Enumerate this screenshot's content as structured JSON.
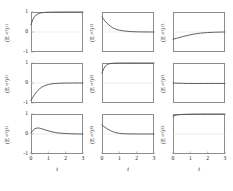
{
  "figure": {
    "rows": 3,
    "cols": 3,
    "xlabel": "t",
    "axis_color": "#8c8c8c",
    "curve_color": "#4d4d4d",
    "zero_gridline_color": "#d8d8d8",
    "xticks": [
      "0",
      "1",
      "2",
      "3"
    ],
    "xlim": [
      0,
      3
    ],
    "yticks": [
      "1",
      "0",
      "-1"
    ],
    "ylim": [
      -1,
      1
    ]
  },
  "chart_data": [
    {
      "type": "line",
      "title": "",
      "panel": "1,1",
      "ylabel_prefix": "(E",
      "ylabel_sub_eff": "eff",
      "ylabel_close": ")",
      "ylabel_index": "11",
      "xlabel": "t",
      "ylabel": "(E_eff)_11",
      "xlim": [
        0,
        3
      ],
      "ylim": [
        -1,
        1
      ],
      "grid": false,
      "x": [
        0,
        0.1,
        0.2,
        0.3,
        0.4,
        0.5,
        0.6,
        0.7,
        0.8,
        0.9,
        1.0,
        1.2,
        1.4,
        1.6,
        1.8,
        2.0,
        2.2,
        2.4,
        2.6,
        2.8,
        3.0
      ],
      "values": [
        0.36,
        0.61,
        0.76,
        0.85,
        0.9,
        0.94,
        0.96,
        0.97,
        0.98,
        0.985,
        0.99,
        0.995,
        0.997,
        0.998,
        0.999,
        1.0,
        1.0,
        1.0,
        1.0,
        1.0,
        1.0
      ]
    },
    {
      "type": "line",
      "title": "",
      "panel": "1,2",
      "ylabel_prefix": "(E",
      "ylabel_sub_eff": "eff",
      "ylabel_close": ")",
      "ylabel_index": "12",
      "xlabel": "t",
      "ylabel": "(E_eff)_12",
      "xlim": [
        0,
        3
      ],
      "ylim": [
        -1,
        1
      ],
      "grid": false,
      "x": [
        0,
        0.1,
        0.2,
        0.3,
        0.4,
        0.5,
        0.6,
        0.7,
        0.8,
        0.9,
        1.0,
        1.2,
        1.4,
        1.6,
        1.8,
        2.0,
        2.2,
        2.4,
        2.6,
        2.8,
        3.0
      ],
      "values": [
        0.75,
        0.63,
        0.52,
        0.43,
        0.35,
        0.28,
        0.22,
        0.18,
        0.14,
        0.11,
        0.09,
        0.06,
        0.04,
        0.025,
        0.015,
        0.01,
        0.006,
        0.004,
        0.002,
        0.001,
        0.0
      ]
    },
    {
      "type": "line",
      "title": "",
      "panel": "1,3",
      "ylabel_prefix": "(E",
      "ylabel_sub_eff": "eff",
      "ylabel_close": ")",
      "ylabel_index": "13",
      "xlabel": "t",
      "ylabel": "(E_eff)_13",
      "xlim": [
        0,
        3
      ],
      "ylim": [
        -1,
        1
      ],
      "grid": false,
      "x": [
        0,
        0.2,
        0.4,
        0.6,
        0.8,
        1.0,
        1.2,
        1.4,
        1.6,
        1.8,
        2.0,
        2.2,
        2.4,
        2.6,
        2.8,
        3.0
      ],
      "values": [
        -0.36,
        -0.32,
        -0.27,
        -0.22,
        -0.18,
        -0.14,
        -0.105,
        -0.08,
        -0.055,
        -0.04,
        -0.028,
        -0.018,
        -0.012,
        -0.007,
        -0.003,
        0.0
      ]
    },
    {
      "type": "line",
      "title": "",
      "panel": "2,1",
      "ylabel_prefix": "(E",
      "ylabel_sub_eff": "eff",
      "ylabel_close": ")",
      "ylabel_index": "21",
      "xlabel": "t",
      "ylabel": "(E_eff)_21",
      "xlim": [
        0,
        3
      ],
      "ylim": [
        -1,
        1
      ],
      "grid": false,
      "x": [
        0,
        0.1,
        0.2,
        0.3,
        0.4,
        0.5,
        0.6,
        0.8,
        1.0,
        1.2,
        1.4,
        1.6,
        1.8,
        2.0,
        2.2,
        2.4,
        2.6,
        2.8,
        3.0
      ],
      "values": [
        -0.87,
        -0.72,
        -0.59,
        -0.47,
        -0.37,
        -0.29,
        -0.22,
        -0.13,
        -0.075,
        -0.042,
        -0.024,
        -0.014,
        -0.008,
        -0.004,
        -0.002,
        -0.001,
        0.0,
        0.0,
        0.0
      ]
    },
    {
      "type": "line",
      "title": "",
      "panel": "2,2",
      "ylabel_prefix": "(E",
      "ylabel_sub_eff": "eff",
      "ylabel_close": ")",
      "ylabel_index": "22",
      "xlabel": "t",
      "ylabel": "(E_eff)_22",
      "xlim": [
        0,
        3
      ],
      "ylim": [
        -1,
        1
      ],
      "grid": false,
      "x": [
        0,
        0.1,
        0.2,
        0.3,
        0.4,
        0.5,
        0.6,
        0.7,
        0.8,
        1.0,
        1.2,
        1.5,
        2.0,
        2.5,
        3.0
      ],
      "values": [
        0.5,
        0.72,
        0.85,
        0.92,
        0.955,
        0.975,
        0.985,
        0.99,
        0.995,
        0.998,
        0.999,
        1.0,
        1.0,
        1.0,
        1.0
      ]
    },
    {
      "type": "line",
      "title": "",
      "panel": "2,3",
      "ylabel_prefix": "(E",
      "ylabel_sub_eff": "eff",
      "ylabel_close": ")",
      "ylabel_index": "23",
      "xlabel": "t",
      "ylabel": "(E_eff)_23",
      "xlim": [
        0,
        3
      ],
      "ylim": [
        -1,
        1
      ],
      "grid": false,
      "x": [
        0,
        0.3,
        0.6,
        0.9,
        1.2,
        1.5,
        1.8,
        2.1,
        2.4,
        2.7,
        3.0
      ],
      "values": [
        0.0,
        -0.012,
        -0.02,
        -0.024,
        -0.026,
        -0.026,
        -0.025,
        -0.024,
        -0.023,
        -0.022,
        -0.022
      ]
    },
    {
      "type": "line",
      "title": "",
      "panel": "3,1",
      "ylabel_prefix": "(E",
      "ylabel_sub_eff": "eff",
      "ylabel_close": ")",
      "ylabel_index": "31",
      "xlabel": "t",
      "ylabel": "(E_eff)_31",
      "xlim": [
        0,
        3
      ],
      "ylim": [
        -1,
        1
      ],
      "grid": false,
      "x": [
        0,
        0.1,
        0.2,
        0.3,
        0.4,
        0.5,
        0.6,
        0.7,
        0.8,
        1.0,
        1.2,
        1.4,
        1.6,
        1.8,
        2.0,
        2.3,
        2.6,
        3.0
      ],
      "values": [
        0.05,
        0.17,
        0.25,
        0.29,
        0.3,
        0.29,
        0.27,
        0.24,
        0.21,
        0.155,
        0.11,
        0.075,
        0.05,
        0.033,
        0.022,
        0.011,
        0.005,
        0.0
      ]
    },
    {
      "type": "line",
      "title": "",
      "panel": "3,2",
      "ylabel_prefix": "(E",
      "ylabel_sub_eff": "eff",
      "ylabel_close": ")",
      "ylabel_index": "32",
      "xlabel": "t",
      "ylabel": "(E_eff)_32",
      "xlim": [
        0,
        3
      ],
      "ylim": [
        -1,
        1
      ],
      "grid": false,
      "x": [
        0,
        0.1,
        0.2,
        0.3,
        0.4,
        0.5,
        0.6,
        0.7,
        0.8,
        0.9,
        1.0,
        1.2,
        1.5,
        2.0,
        2.5,
        3.0
      ],
      "values": [
        0.45,
        0.38,
        0.32,
        0.26,
        0.21,
        0.165,
        0.125,
        0.095,
        0.07,
        0.05,
        0.035,
        0.018,
        0.006,
        0.001,
        0.0,
        0.0
      ]
    },
    {
      "type": "line",
      "title": "",
      "panel": "3,3",
      "ylabel_prefix": "(E",
      "ylabel_sub_eff": "eff",
      "ylabel_close": ")",
      "ylabel_index": "33",
      "xlabel": "t",
      "ylabel": "(E_eff)_33",
      "xlim": [
        0,
        3
      ],
      "ylim": [
        -1,
        1
      ],
      "grid": false,
      "x": [
        0,
        0.2,
        0.4,
        0.6,
        0.8,
        1.0,
        1.3,
        1.6,
        2.0,
        2.4,
        3.0
      ],
      "values": [
        0.9,
        0.945,
        0.968,
        0.981,
        0.989,
        0.993,
        0.997,
        0.999,
        1.0,
        1.0,
        1.0
      ]
    }
  ]
}
